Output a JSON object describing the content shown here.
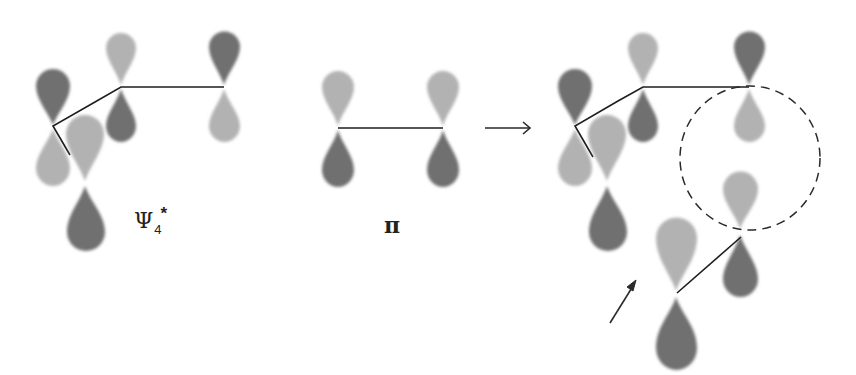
{
  "figure": {
    "colors": {
      "light_lobe": "#b2b2b2",
      "dark_lobe": "#6f6f6f",
      "line": "#1e1e1e"
    },
    "labels": {
      "psi_symbol": "Ψ",
      "psi_subscript": "4",
      "psi_superscript": "*",
      "pi": "π"
    },
    "panels": [
      {
        "name": "psi4-star",
        "label": "Ψ4*"
      },
      {
        "name": "pi",
        "label": "π"
      },
      {
        "name": "interaction",
        "label": ""
      }
    ],
    "annotations": {
      "reaction_arrow": "→",
      "approach_arrow": "↗",
      "highlight": "dashed circle around in-phase overlap"
    }
  }
}
